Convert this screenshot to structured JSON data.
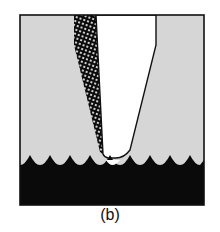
{
  "figure": {
    "caption": "(b)",
    "colors": {
      "background": "#ffffff",
      "medium": "#d6d6d6",
      "substrate": "#0a0a0a",
      "tool": "#ffffff",
      "outline": "#111111",
      "hatch": "#0a0a0a"
    },
    "elements": [
      "frame",
      "gray-medium",
      "hatched-layer",
      "white-tool",
      "wavy-substrate"
    ]
  }
}
